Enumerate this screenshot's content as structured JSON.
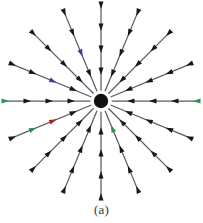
{
  "figure": {
    "caption": "(a)",
    "background_color": "#ffffff",
    "center_dot": {
      "name": "point-charge-dot",
      "cx": 101,
      "cy": 101,
      "r": 7.2,
      "color": "#121212"
    },
    "geometry": {
      "ray_count": 16,
      "angle_step_deg": 22.5,
      "inner_radius": 11,
      "outer_radius": 97,
      "arrowheads_per_ray": 4,
      "direction": "inward"
    },
    "style": {
      "shaft_color": "#5a5a66",
      "shaft_width": 1.25,
      "head_color": "#16161e",
      "head_length": 7.5,
      "head_width": 5.0
    }
  },
  "chart_data": {
    "type": "scatter",
    "subtitle": "(a)",
    "xlabel": "",
    "ylabel": "",
    "grid": false,
    "legend": null,
    "xlim": [
      -100,
      100
    ],
    "ylim": [
      -100,
      100
    ],
    "singularity": {
      "x": 0,
      "y": 0,
      "kind": "sink",
      "marker": "filled-circle"
    },
    "ray_angles_deg": [
      0,
      22.5,
      45,
      67.5,
      90,
      112.5,
      135,
      157.5,
      180,
      202.5,
      225,
      247.5,
      270,
      292.5,
      315,
      337.5
    ],
    "arrow_radii": [
      26,
      48,
      70,
      92
    ],
    "arrow_direction": "inward",
    "vectors": [
      {
        "angle_deg": 0,
        "r": 26,
        "x": 26.0,
        "y": 0.0,
        "u": -1,
        "v": 0
      },
      {
        "angle_deg": 0,
        "r": 48,
        "x": 48.0,
        "y": 0.0,
        "u": -1,
        "v": 0
      },
      {
        "angle_deg": 0,
        "r": 70,
        "x": 70.0,
        "y": 0.0,
        "u": -1,
        "v": 0
      },
      {
        "angle_deg": 0,
        "r": 92,
        "x": 92.0,
        "y": 0.0,
        "u": -1,
        "v": 0
      },
      {
        "angle_deg": 22.5,
        "r": 26,
        "x": 24.0,
        "y": 10.0,
        "u": -0.92,
        "v": -0.38
      },
      {
        "angle_deg": 22.5,
        "r": 48,
        "x": 44.3,
        "y": 18.4,
        "u": -0.92,
        "v": -0.38
      },
      {
        "angle_deg": 22.5,
        "r": 70,
        "x": 64.7,
        "y": 26.8,
        "u": -0.92,
        "v": -0.38
      },
      {
        "angle_deg": 22.5,
        "r": 92,
        "x": 85.0,
        "y": 35.2,
        "u": -0.92,
        "v": -0.38
      },
      {
        "angle_deg": 45,
        "r": 26,
        "x": 18.4,
        "y": 18.4,
        "u": -0.71,
        "v": -0.71
      },
      {
        "angle_deg": 45,
        "r": 48,
        "x": 33.9,
        "y": 33.9,
        "u": -0.71,
        "v": -0.71
      },
      {
        "angle_deg": 45,
        "r": 70,
        "x": 49.5,
        "y": 49.5,
        "u": -0.71,
        "v": -0.71
      },
      {
        "angle_deg": 45,
        "r": 92,
        "x": 65.1,
        "y": 65.1,
        "u": -0.71,
        "v": -0.71
      },
      {
        "angle_deg": 67.5,
        "r": 26,
        "x": 10.0,
        "y": 24.0,
        "u": -0.38,
        "v": -0.92
      },
      {
        "angle_deg": 67.5,
        "r": 48,
        "x": 18.4,
        "y": 44.3,
        "u": -0.38,
        "v": -0.92
      },
      {
        "angle_deg": 67.5,
        "r": 70,
        "x": 26.8,
        "y": 64.7,
        "u": -0.38,
        "v": -0.92
      },
      {
        "angle_deg": 67.5,
        "r": 92,
        "x": 35.2,
        "y": 85.0,
        "u": -0.38,
        "v": -0.92
      },
      {
        "angle_deg": 90,
        "r": 26,
        "x": 0.0,
        "y": 26.0,
        "u": 0,
        "v": -1
      },
      {
        "angle_deg": 90,
        "r": 48,
        "x": 0.0,
        "y": 48.0,
        "u": 0,
        "v": -1
      },
      {
        "angle_deg": 90,
        "r": 70,
        "x": 0.0,
        "y": 70.0,
        "u": 0,
        "v": -1
      },
      {
        "angle_deg": 90,
        "r": 92,
        "x": 0.0,
        "y": 92.0,
        "u": 0,
        "v": -1
      },
      {
        "angle_deg": 112.5,
        "r": 26,
        "x": -10.0,
        "y": 24.0,
        "u": 0.38,
        "v": -0.92
      },
      {
        "angle_deg": 112.5,
        "r": 48,
        "x": -18.4,
        "y": 44.3,
        "u": 0.38,
        "v": -0.92
      },
      {
        "angle_deg": 112.5,
        "r": 70,
        "x": -26.8,
        "y": 64.7,
        "u": 0.38,
        "v": -0.92
      },
      {
        "angle_deg": 112.5,
        "r": 92,
        "x": -35.2,
        "y": 85.0,
        "u": 0.38,
        "v": -0.92
      },
      {
        "angle_deg": 135,
        "r": 26,
        "x": -18.4,
        "y": 18.4,
        "u": 0.71,
        "v": -0.71
      },
      {
        "angle_deg": 135,
        "r": 48,
        "x": -33.9,
        "y": 33.9,
        "u": 0.71,
        "v": -0.71
      },
      {
        "angle_deg": 135,
        "r": 70,
        "x": -49.5,
        "y": 49.5,
        "u": 0.71,
        "v": -0.71
      },
      {
        "angle_deg": 135,
        "r": 92,
        "x": -65.1,
        "y": 65.1,
        "u": 0.71,
        "v": -0.71
      },
      {
        "angle_deg": 157.5,
        "r": 26,
        "x": -24.0,
        "y": 10.0,
        "u": 0.92,
        "v": -0.38
      },
      {
        "angle_deg": 157.5,
        "r": 48,
        "x": -44.3,
        "y": 18.4,
        "u": 0.92,
        "v": -0.38
      },
      {
        "angle_deg": 157.5,
        "r": 70,
        "x": -64.7,
        "y": 26.8,
        "u": 0.92,
        "v": -0.38
      },
      {
        "angle_deg": 157.5,
        "r": 92,
        "x": -85.0,
        "y": 35.2,
        "u": 0.92,
        "v": -0.38
      },
      {
        "angle_deg": 180,
        "r": 26,
        "x": -26.0,
        "y": 0.0,
        "u": 1,
        "v": 0
      },
      {
        "angle_deg": 180,
        "r": 48,
        "x": -48.0,
        "y": 0.0,
        "u": 1,
        "v": 0
      },
      {
        "angle_deg": 180,
        "r": 70,
        "x": -70.0,
        "y": 0.0,
        "u": 1,
        "v": 0
      },
      {
        "angle_deg": 180,
        "r": 92,
        "x": -92.0,
        "y": 0.0,
        "u": 1,
        "v": 0
      },
      {
        "angle_deg": 202.5,
        "r": 26,
        "x": -24.0,
        "y": -10.0,
        "u": 0.92,
        "v": 0.38
      },
      {
        "angle_deg": 202.5,
        "r": 48,
        "x": -44.3,
        "y": -18.4,
        "u": 0.92,
        "v": 0.38
      },
      {
        "angle_deg": 202.5,
        "r": 70,
        "x": -64.7,
        "y": -26.8,
        "u": 0.92,
        "v": 0.38
      },
      {
        "angle_deg": 202.5,
        "r": 92,
        "x": -85.0,
        "y": -35.2,
        "u": 0.92,
        "v": 0.38
      },
      {
        "angle_deg": 225,
        "r": 26,
        "x": -18.4,
        "y": -18.4,
        "u": 0.71,
        "v": 0.71
      },
      {
        "angle_deg": 225,
        "r": 48,
        "x": -33.9,
        "y": -33.9,
        "u": 0.71,
        "v": 0.71
      },
      {
        "angle_deg": 225,
        "r": 70,
        "x": -49.5,
        "y": -49.5,
        "u": 0.71,
        "v": 0.71
      },
      {
        "angle_deg": 225,
        "r": 92,
        "x": -65.1,
        "y": -65.1,
        "u": 0.71,
        "v": 0.71
      },
      {
        "angle_deg": 247.5,
        "r": 26,
        "x": -10.0,
        "y": -24.0,
        "u": 0.38,
        "v": 0.92
      },
      {
        "angle_deg": 247.5,
        "r": 48,
        "x": -18.4,
        "y": -44.3,
        "u": 0.38,
        "v": 0.92
      },
      {
        "angle_deg": 247.5,
        "r": 70,
        "x": -26.8,
        "y": -64.7,
        "u": 0.38,
        "v": 0.92
      },
      {
        "angle_deg": 247.5,
        "r": 92,
        "x": -35.2,
        "y": -85.0,
        "u": 0.38,
        "v": 0.92
      },
      {
        "angle_deg": 270,
        "r": 26,
        "x": 0.0,
        "y": -26.0,
        "u": 0,
        "v": 1
      },
      {
        "angle_deg": 270,
        "r": 48,
        "x": 0.0,
        "y": -48.0,
        "u": 0,
        "v": 1
      },
      {
        "angle_deg": 270,
        "r": 70,
        "x": 0.0,
        "y": -70.0,
        "u": 0,
        "v": 1
      },
      {
        "angle_deg": 270,
        "r": 92,
        "x": 0.0,
        "y": -92.0,
        "u": 0,
        "v": 1
      },
      {
        "angle_deg": 292.5,
        "r": 26,
        "x": 10.0,
        "y": -24.0,
        "u": -0.38,
        "v": 0.92
      },
      {
        "angle_deg": 292.5,
        "r": 48,
        "x": 18.4,
        "y": -44.3,
        "u": -0.38,
        "v": 0.92
      },
      {
        "angle_deg": 292.5,
        "r": 70,
        "x": 26.8,
        "y": -64.7,
        "u": -0.38,
        "v": 0.92
      },
      {
        "angle_deg": 292.5,
        "r": 92,
        "x": 35.2,
        "y": -85.0,
        "u": -0.38,
        "v": 0.92
      },
      {
        "angle_deg": 315,
        "r": 26,
        "x": 18.4,
        "y": -18.4,
        "u": -0.71,
        "v": 0.71
      },
      {
        "angle_deg": 315,
        "r": 48,
        "x": 33.9,
        "y": -33.9,
        "u": -0.71,
        "v": 0.71
      },
      {
        "angle_deg": 315,
        "r": 70,
        "x": 49.5,
        "y": -49.5,
        "u": -0.71,
        "v": 0.71
      },
      {
        "angle_deg": 315,
        "r": 92,
        "x": 65.1,
        "y": -65.1,
        "u": -0.71,
        "v": 0.71
      },
      {
        "angle_deg": 337.5,
        "r": 26,
        "x": 24.0,
        "y": -10.0,
        "u": -0.92,
        "v": 0.38
      },
      {
        "angle_deg": 337.5,
        "r": 48,
        "x": 44.3,
        "y": -18.4,
        "u": -0.92,
        "v": 0.38
      },
      {
        "angle_deg": 337.5,
        "r": 70,
        "x": 64.7,
        "y": -26.8,
        "u": -0.92,
        "v": 0.38
      },
      {
        "angle_deg": 337.5,
        "r": 92,
        "x": 85.0,
        "y": -35.2,
        "u": -0.92,
        "v": 0.38
      }
    ],
    "colored_artifact_arrows": [
      {
        "angle_deg": 157.5,
        "r": 48,
        "tint": "#3a3ab0",
        "note": "blue fringe"
      },
      {
        "angle_deg": 112.5,
        "r": 48,
        "tint": "#3a3ab0",
        "note": "blue fringe"
      },
      {
        "angle_deg": 180,
        "r": 92,
        "tint": "#2f8f4f",
        "note": "green fringe"
      },
      {
        "angle_deg": 0,
        "r": 92,
        "tint": "#2f8f4f",
        "note": "green fringe"
      },
      {
        "angle_deg": 202.5,
        "r": 48,
        "tint": "#b02020",
        "note": "red fringe"
      },
      {
        "angle_deg": 202.5,
        "r": 70,
        "tint": "#2f8f4f",
        "note": "green fringe"
      },
      {
        "angle_deg": 292.5,
        "r": 26,
        "tint": "#2f8f4f",
        "note": "green fringe"
      }
    ]
  }
}
